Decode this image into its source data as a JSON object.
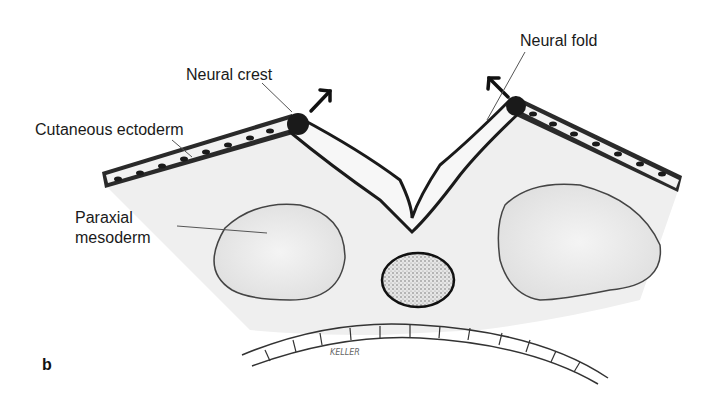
{
  "figure": {
    "panel_letter": "b",
    "signature": "KELLER",
    "labels": {
      "neural_crest": "Neural crest",
      "neural_fold": "Neural fold",
      "cutaneous_ectoderm": "Cutaneous ectoderm",
      "paraxial_mesoderm_line1": "Paraxial",
      "paraxial_mesoderm_line2": "mesoderm"
    },
    "colors": {
      "ink": "#1a1a1a",
      "tissue_fill": "#ececec",
      "neural_plate_fill": "#f6f6f6",
      "background": "#ffffff"
    }
  }
}
